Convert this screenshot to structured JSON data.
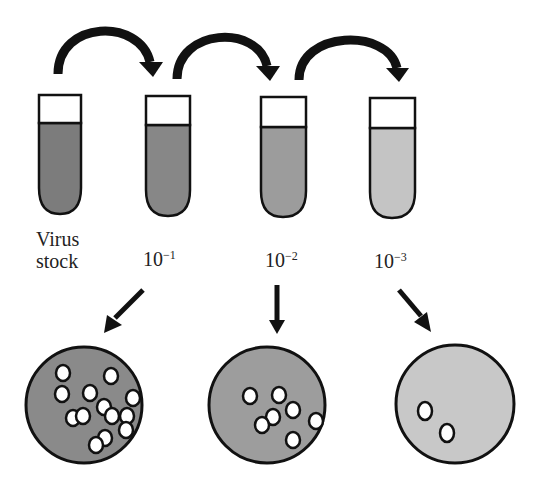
{
  "diagram": {
    "tubes": [
      {
        "id": "stock",
        "label_line1": "Virus",
        "label_line2": "stock",
        "fill_color": "#7c7c7c"
      },
      {
        "id": "d1",
        "label_base": "10",
        "label_exp": "−1",
        "fill_color": "#878787"
      },
      {
        "id": "d2",
        "label_base": "10",
        "label_exp": "−2",
        "fill_color": "#9c9c9c"
      },
      {
        "id": "d3",
        "label_base": "10",
        "label_exp": "−3",
        "fill_color": "#c4c4c4"
      }
    ],
    "transfer_arrows": [
      {
        "from": "Virus stock",
        "to": "10−1"
      },
      {
        "from": "10−1",
        "to": "10−2"
      },
      {
        "from": "10−2",
        "to": "10−3"
      }
    ],
    "plates": [
      {
        "dilution": "10−1",
        "plaque_count": 16,
        "fill_color": "#8a8a8a"
      },
      {
        "dilution": "10−2",
        "plaque_count": 8,
        "fill_color": "#9d9d9d"
      },
      {
        "dilution": "10−3",
        "plaque_count": 2,
        "fill_color": "#c8c8c8"
      }
    ],
    "colors": {
      "outline": "#111111",
      "arrow": "#111111",
      "plaque": "#ffffff",
      "background": "#ffffff"
    }
  }
}
